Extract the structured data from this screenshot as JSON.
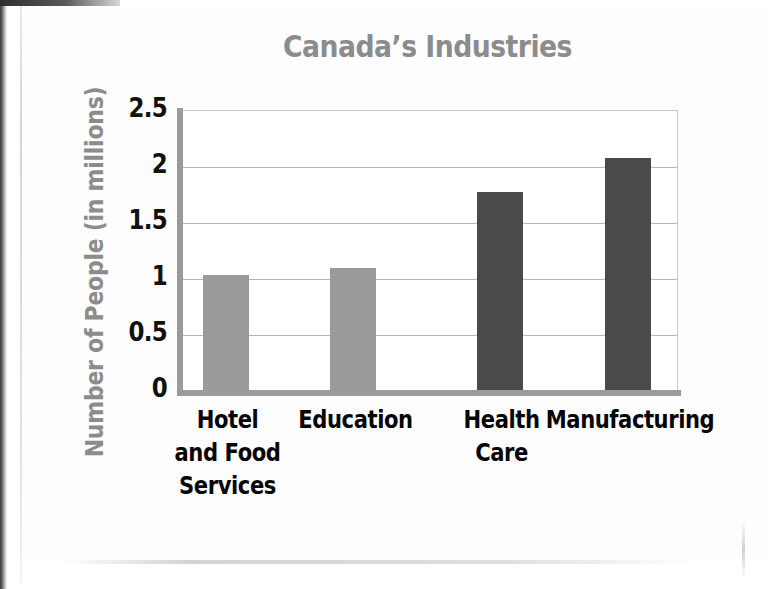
{
  "page": {
    "background": "#ffffff",
    "paper": "#fdfdfd"
  },
  "chart_data": {
    "type": "bar",
    "title": "Canada’s Industries",
    "xlabel": "",
    "ylabel": "Number of People (in millions)",
    "categories": [
      "Hotel and Food Services",
      "Education",
      "Health Care",
      "Manufacturing"
    ],
    "category_lines": [
      [
        "Hotel",
        "and Food",
        "Services"
      ],
      [
        "Education"
      ],
      [
        "Health",
        "Care"
      ],
      [
        "Manufacturing"
      ]
    ],
    "values": [
      1.03,
      1.09,
      1.77,
      2.07
    ],
    "bar_colors": [
      "#9a9a9a",
      "#9a9a9a",
      "#4a4a4a",
      "#4a4a4a"
    ],
    "ylim": [
      0,
      2.5
    ],
    "ytick_values": [
      0,
      0.5,
      1,
      1.5,
      2,
      2.5
    ],
    "ytick_labels": [
      "0",
      "0.5",
      "1",
      "1.5",
      "2",
      "2.5"
    ],
    "grid": true,
    "grid_axis": "y",
    "legend": false,
    "legend_position": "none"
  },
  "colors": {
    "title_gray": "#8c8c8c",
    "axis_title_gray": "#8c8c8c",
    "tick_black": "#111111",
    "bar_light": "#9a9a9a",
    "bar_dark": "#4a4a4a",
    "gridline": "#b5b5b5",
    "axis_line": "#9b9b9b"
  }
}
